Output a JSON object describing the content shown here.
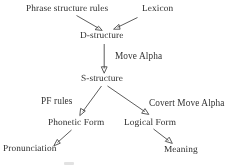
{
  "diagram": {
    "type": "flow-diagram",
    "background_color": "#ffffff",
    "line_color": "#4a4a4a",
    "text_color": "#2e2e2e",
    "nodes": [
      {
        "id": "phrase-structure-rules",
        "label": "Phrase structure rules",
        "x": 26,
        "y": 4
      },
      {
        "id": "lexicon",
        "label": "Lexicon",
        "x": 142,
        "y": 4
      },
      {
        "id": "d-structure",
        "label": "D-structure",
        "x": 80,
        "y": 31
      },
      {
        "id": "s-structure",
        "label": "S-structure",
        "x": 81,
        "y": 74
      },
      {
        "id": "phonetic-form",
        "label": "Phonetic Form",
        "x": 48,
        "y": 118
      },
      {
        "id": "logical-form",
        "label": "Logical Form",
        "x": 124,
        "y": 118
      },
      {
        "id": "pronunciation",
        "label": "Pronunciation",
        "x": 3,
        "y": 144
      },
      {
        "id": "meaning",
        "label": "Meaning",
        "x": 164,
        "y": 145
      }
    ],
    "edge_labels": [
      {
        "id": "move-alpha",
        "label": "Move Alpha",
        "x": 115,
        "y": 51
      },
      {
        "id": "pf-rules",
        "label": "PF rules",
        "x": 41,
        "y": 96
      },
      {
        "id": "covert-move-alpha",
        "label": "Covert Move Alpha",
        "x": 149,
        "y": 98
      }
    ],
    "edges": [
      {
        "id": "edge-psr-to-d",
        "from": "phrase-structure-rules",
        "to": "d-structure"
      },
      {
        "id": "edge-lexicon-to-d",
        "from": "lexicon",
        "to": "d-structure"
      },
      {
        "id": "edge-d-to-s",
        "from": "d-structure",
        "to": "s-structure",
        "label": "Move Alpha"
      },
      {
        "id": "edge-s-to-pf",
        "from": "s-structure",
        "to": "phonetic-form",
        "label": "PF rules"
      },
      {
        "id": "edge-s-to-lf",
        "from": "s-structure",
        "to": "logical-form",
        "label": "Covert Move Alpha"
      },
      {
        "id": "edge-pf-to-pronunciation",
        "from": "phonetic-form",
        "to": "pronunciation"
      },
      {
        "id": "edge-lf-to-meaning",
        "from": "logical-form",
        "to": "meaning"
      }
    ]
  }
}
